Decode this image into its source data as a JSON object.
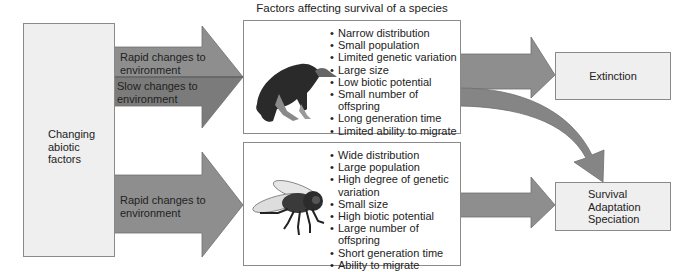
{
  "diagram": {
    "title": "Factors affecting survival of a species",
    "source": {
      "label_lines": [
        "Changing",
        "abiotic",
        "factors"
      ]
    },
    "arrows": {
      "top_upper": "Rapid changes to environment",
      "top_upper_lines": [
        "Rapid changes to",
        "environment"
      ],
      "top_lower_lines": [
        "Slow changes to",
        "environment"
      ],
      "bottom_lines": [
        "Rapid changes to",
        "environment"
      ]
    },
    "species_top": {
      "icon": "vulture-icon",
      "factors": [
        "Narrow distribution",
        "Small population",
        "Limited genetic variation",
        "Large size",
        "Low biotic potential",
        "Small number of offspring",
        "Long generation time",
        "Limited ability to migrate"
      ]
    },
    "species_bottom": {
      "icon": "fly-icon",
      "factors": [
        "Wide distribution",
        "Large population",
        "High degree of genetic variation",
        "Small size",
        "High biotic potential",
        "Large number of offspring",
        "Short generation time",
        "Ability to migrate"
      ]
    },
    "outcomes": {
      "extinction": "Extinction",
      "survival_lines": [
        "Survival",
        "Adaptation",
        "Speciation"
      ]
    },
    "colors": {
      "box_fill": "#efefef",
      "arrow_rapid": "#8c8c8c",
      "arrow_slow": "#7a7a7a",
      "border": "#8a8a8a"
    }
  }
}
